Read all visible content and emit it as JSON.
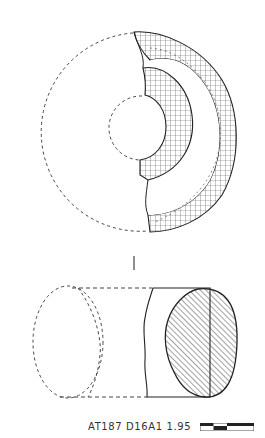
{
  "figure": {
    "views": [
      {
        "name": "plan-view",
        "description": "Top view of ring fragment with reconstructed dashed outline"
      },
      {
        "name": "profile-view",
        "description": "Side section view with hatched cross-section"
      }
    ],
    "section_mark": "|",
    "caption": "AT187 D16A1 1.95",
    "scale_bar": {
      "segments": 4
    },
    "colors": {
      "ink": "#222222",
      "background": "#ffffff"
    }
  }
}
